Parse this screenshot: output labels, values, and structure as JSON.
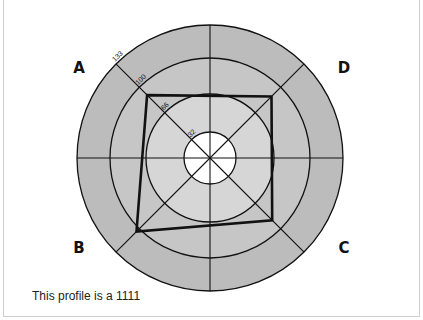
{
  "chart_data": {
    "type": "radar",
    "title": "",
    "axes": [
      "A",
      "D",
      "C",
      "B"
    ],
    "ring_values": [
      32,
      66,
      100,
      133
    ],
    "ring_labels": [
      "32",
      "66",
      "100",
      "133"
    ],
    "rmax": 133,
    "series": [
      {
        "name": "profile",
        "values": {
          "A": 89,
          "D": 87,
          "C": 88,
          "B": 104
        }
      }
    ],
    "grid": true,
    "spokes": 8,
    "caption": "This profile is a 1111"
  },
  "labels": {
    "A": "A",
    "B": "B",
    "C": "C",
    "D": "D"
  },
  "caption": "This profile is a 1111",
  "colors": {
    "outer_band": "#bcbcbc",
    "mid_band": "#c6c6c6",
    "inner_band": "#d6d6d6",
    "center": "#ffffff",
    "lines": "#111111",
    "polygon": "#111111"
  }
}
